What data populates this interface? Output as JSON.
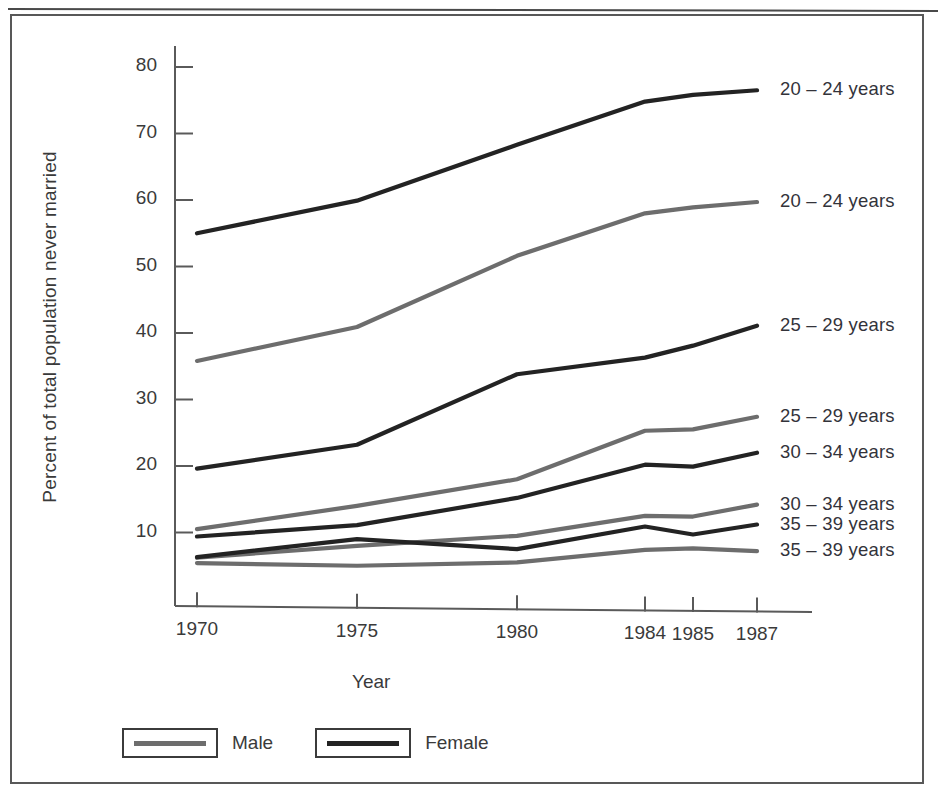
{
  "figure": {
    "top_cut_caption": "",
    "legend": {
      "items": [
        {
          "label": "Male",
          "key": "male",
          "color": "#6d6d6d"
        },
        {
          "label": "Female",
          "key": "female",
          "color": "#232323"
        }
      ]
    }
  },
  "chart_data": {
    "type": "line",
    "title": "",
    "xlabel": "Year",
    "ylabel": "Percent of total population never married",
    "x": [
      1970,
      1975,
      1980,
      1984,
      1985,
      1987
    ],
    "xticklabels": [
      "1970",
      "1975",
      "1980",
      "1984",
      "1985",
      "1987"
    ],
    "yticks": [
      10,
      20,
      30,
      40,
      50,
      60,
      70,
      80
    ],
    "yticklabels": [
      "10",
      "20",
      "30",
      "40",
      "50",
      "60",
      "70",
      "80"
    ],
    "ylim": [
      0,
      85
    ],
    "xlim": [
      1968.5,
      1988.5
    ],
    "grid": false,
    "legend_position": "below-axes-left",
    "colors": {
      "male": "#6d6d6d",
      "female": "#232323"
    },
    "series": [
      {
        "name": "20 – 24 years",
        "sex": "Female",
        "color": "#232323",
        "label": "20 – 24 years",
        "values": [
          55.0,
          59.9,
          68.3,
          74.8,
          75.8,
          76.5
        ]
      },
      {
        "name": "20 – 24 years",
        "sex": "Male",
        "color": "#6d6d6d",
        "label": "20 – 24 years",
        "values": [
          35.8,
          40.9,
          51.6,
          58.0,
          58.9,
          59.7
        ]
      },
      {
        "name": "25 – 29 years",
        "sex": "Female",
        "color": "#232323",
        "label": "25 – 29 years",
        "values": [
          19.6,
          23.2,
          33.8,
          36.3,
          38.1,
          41.1
        ]
      },
      {
        "name": "25 – 29 years",
        "sex": "Male",
        "color": "#6d6d6d",
        "label": "25 – 29 years",
        "values": [
          10.5,
          14.0,
          18.0,
          25.3,
          25.5,
          27.4
        ]
      },
      {
        "name": "30 – 34 years",
        "sex": "Female",
        "color": "#232323",
        "label": "30 – 34 years",
        "values": [
          9.4,
          11.1,
          15.2,
          20.2,
          19.9,
          22.0
        ]
      },
      {
        "name": "30 – 34 years",
        "sex": "Male",
        "color": "#6d6d6d",
        "label": "30 – 34 years",
        "values": [
          6.2,
          8.0,
          9.5,
          12.5,
          12.4,
          14.2
        ]
      },
      {
        "name": "35 – 39 years",
        "sex": "Female",
        "color": "#232323",
        "label": "35 – 39 years",
        "values": [
          6.3,
          9.0,
          7.5,
          10.9,
          9.7,
          11.2
        ]
      },
      {
        "name": "35 – 39 years",
        "sex": "Male",
        "color": "#6d6d6d",
        "label": "35 – 39 years",
        "values": [
          5.4,
          5.0,
          5.5,
          7.4,
          7.6,
          7.2
        ]
      }
    ],
    "series_end_labels": [
      {
        "text": "20 – 24 years",
        "y": 76.5
      },
      {
        "text": "20 – 24 years",
        "y": 59.7
      },
      {
        "text": "25 – 29 years",
        "y": 41.1
      },
      {
        "text": "25 – 29 years",
        "y": 27.4
      },
      {
        "text": "30 – 34 years",
        "y": 22.0
      },
      {
        "text": "30 – 34 years",
        "y": 14.2
      },
      {
        "text": "35 – 39 years",
        "y": 11.2
      },
      {
        "text": "35 – 39 years",
        "y": 7.2
      }
    ]
  }
}
